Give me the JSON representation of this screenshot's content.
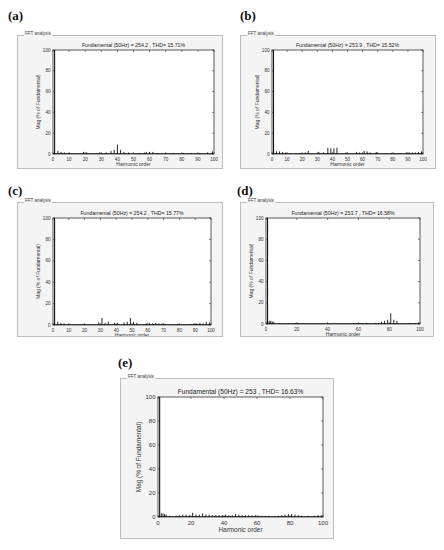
{
  "panels": [
    {
      "label": "(a)",
      "frame_title": "FFT analysis",
      "title": "Fundamental (50Hz) = 254.2 , THD= 15.71%"
    },
    {
      "label": "(b)",
      "frame_title": "FFT analysis",
      "title": "Fundamental (50Hz) = 253.9 , THD= 15.52%"
    },
    {
      "label": "(c)",
      "frame_title": "FFT analysis",
      "title": "Fundamental (50Hz) = 254.2 , THD= 15.77%"
    },
    {
      "label": "(d)",
      "frame_title": "FFT analysis",
      "title": "Fundamental (50Hz) = 253.7 , THD= 16.58%"
    },
    {
      "label": "(e)",
      "frame_title": "FFT analysis",
      "title": "Fundamental (50Hz) = 253 , THD= 16.63%"
    }
  ],
  "chart_data": [
    {
      "type": "bar",
      "panel": "(a)",
      "title": "Fundamental (50Hz) = 254.2 , THD= 15.71%",
      "xlabel": "Harmonic order",
      "ylabel": "Mag (% of Fundamental)",
      "xlim": [
        0,
        100
      ],
      "ylim": [
        0,
        100
      ],
      "xticks": [
        0,
        10,
        20,
        30,
        40,
        50,
        60,
        70,
        80,
        90,
        100
      ],
      "yticks": [
        0,
        20,
        40,
        60,
        80,
        100
      ],
      "x": [
        1,
        3,
        5,
        7,
        10,
        19,
        21,
        29,
        33,
        36,
        38,
        40,
        42,
        44,
        47,
        54,
        57,
        58,
        60,
        62,
        65,
        70,
        75,
        81,
        86,
        91,
        96,
        99
      ],
      "values": [
        100,
        3,
        2,
        1.5,
        1,
        2,
        1.5,
        1.5,
        1.5,
        3,
        4,
        9,
        4,
        2,
        1.5,
        1,
        1.5,
        2,
        2,
        2,
        1,
        1,
        1,
        1,
        1,
        1,
        1.5,
        2.5
      ]
    },
    {
      "type": "bar",
      "panel": "(b)",
      "title": "Fundamental (50Hz) = 253.9 , THD= 15.52%",
      "xlabel": "Harmonic order",
      "ylabel": "Mag (% of Fundamental)",
      "xlim": [
        0,
        100
      ],
      "ylim": [
        0,
        100
      ],
      "xticks": [
        0,
        10,
        20,
        30,
        40,
        50,
        60,
        70,
        80,
        90,
        100
      ],
      "yticks": [
        0,
        20,
        40,
        60,
        80,
        100
      ],
      "x": [
        1,
        3,
        5,
        7,
        9,
        19,
        22,
        24,
        31,
        34,
        37,
        39,
        41,
        43,
        49,
        56,
        58,
        61,
        63,
        65,
        69,
        79,
        81,
        89,
        91,
        93,
        95,
        97,
        99
      ],
      "values": [
        100,
        2.5,
        2.5,
        2,
        1.5,
        1,
        1.5,
        3,
        2,
        1.5,
        6,
        5.5,
        5.5,
        6,
        1.5,
        2,
        1.5,
        3,
        2.5,
        1.5,
        2,
        1,
        1,
        1.5,
        1.5,
        1.5,
        1.5,
        2,
        2.5
      ]
    },
    {
      "type": "bar",
      "panel": "(c)",
      "title": "Fundamental (50Hz) = 254.2 , THD= 15.77%",
      "xlabel": "Harmonic order",
      "ylabel": "Mag (% of Fundamental)",
      "xlim": [
        0,
        100
      ],
      "ylim": [
        0,
        100
      ],
      "xticks": [
        0,
        10,
        20,
        30,
        40,
        50,
        60,
        70,
        80,
        90,
        100
      ],
      "yticks": [
        0,
        20,
        40,
        60,
        80,
        100
      ],
      "x": [
        1,
        3,
        5,
        7,
        10,
        19,
        29,
        31,
        33,
        35,
        39,
        41,
        45,
        47,
        49,
        51,
        53,
        59,
        61,
        63,
        65,
        67,
        69,
        71,
        79,
        87,
        89,
        91,
        93,
        95,
        97,
        99
      ],
      "values": [
        100,
        3,
        2,
        1.5,
        1,
        1,
        2.5,
        6.5,
        2,
        3,
        2,
        2,
        2.5,
        3,
        6.5,
        3,
        2,
        1.5,
        2,
        1.5,
        2,
        1.5,
        1.5,
        1,
        1,
        1,
        1.5,
        1.5,
        2,
        1.5,
        3,
        2.5
      ]
    },
    {
      "type": "bar",
      "panel": "(d)",
      "title": "Fundamental (50Hz) = 253.7 , THD= 16.58%",
      "xlabel": "Harmonic order",
      "ylabel": "Mag (% of Fundamental)",
      "xlim": [
        0,
        100
      ],
      "ylim": [
        0,
        100
      ],
      "xticks": [
        0,
        20,
        40,
        60,
        80,
        100
      ],
      "yticks": [
        0,
        20,
        40,
        60,
        80,
        100
      ],
      "x": [
        1,
        2,
        3,
        4,
        5,
        19,
        21,
        57,
        59,
        61,
        63,
        65,
        71,
        73,
        75,
        77,
        79,
        81,
        83,
        85,
        93,
        97,
        99
      ],
      "values": [
        100,
        3,
        3,
        2.5,
        2,
        1,
        1,
        1,
        1,
        1,
        1,
        1,
        1,
        1,
        2,
        3,
        4,
        10,
        4,
        3,
        1,
        1,
        1.5
      ]
    },
    {
      "type": "bar",
      "panel": "(e)",
      "title": "Fundamental (50Hz) = 253 , THD= 16.63%",
      "xlabel": "Harmonic order",
      "ylabel": "Mag (% of Fundamental)",
      "xlim": [
        0,
        100
      ],
      "ylim": [
        0,
        100
      ],
      "xticks": [
        0,
        20,
        40,
        60,
        80,
        100
      ],
      "yticks": [
        0,
        20,
        40,
        60,
        80,
        100
      ],
      "x": [
        1,
        2,
        3,
        4,
        5,
        7,
        11,
        13,
        15,
        17,
        19,
        21,
        23,
        25,
        27,
        29,
        31,
        33,
        35,
        37,
        39,
        41,
        43,
        45,
        47,
        49,
        51,
        53,
        55,
        57,
        59,
        61,
        63,
        65,
        67,
        73,
        75,
        77,
        79,
        81,
        83,
        85,
        87,
        91,
        95,
        97,
        99
      ],
      "values": [
        100,
        3,
        3,
        2.5,
        2,
        1,
        1,
        1.5,
        2,
        2,
        1.5,
        3.5,
        2,
        2,
        3,
        2,
        2,
        1.5,
        1.5,
        1.5,
        1.5,
        2,
        1.5,
        1.5,
        2.5,
        2,
        1.5,
        1.5,
        1.5,
        1.5,
        1.5,
        1,
        1,
        1,
        1,
        1,
        1.5,
        2,
        2.5,
        2.5,
        2,
        1.5,
        1,
        1,
        1,
        1.5,
        1.5
      ]
    }
  ]
}
